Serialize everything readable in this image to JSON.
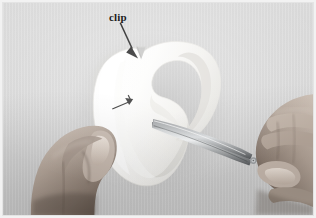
{
  "figure": {
    "kind": "instructional-photo",
    "background_color": "#d8d8d8",
    "frame_color": "#e4e4e4",
    "mat_color": "#ffffff"
  },
  "annotations": {
    "clip_label": {
      "text": "clip",
      "color": "#1d1d1d",
      "x": 106,
      "y": 9
    },
    "clip_arrow": {
      "name": "clip-pointer-arrow",
      "color": "#121212",
      "from_x": 120,
      "from_y": 22,
      "to_x": 134,
      "to_y": 54
    },
    "seam_arrow": {
      "name": "seam-direction-arrow",
      "color": "#1a1a1a",
      "from_x": 112,
      "from_y": 108,
      "to_x": 131,
      "to_y": 99
    }
  },
  "objects": {
    "fabric": {
      "name": "curved-fabric-piece",
      "color": "#fbfbfa",
      "shadow_color": "#b9b9b9",
      "edge_color": "#e9e9e7",
      "description": "white curved pattern piece with a V notch clipped at the top edge"
    },
    "notch": {
      "name": "clipped-notch",
      "color": "#cfcfcf",
      "description": "V-shaped clip cut into the concave curve at the top"
    },
    "scissors": {
      "name": "scissors",
      "blade_color": "#b7b9bb",
      "blade_highlight": "#f0f2f3",
      "blade_shadow": "#6d7073",
      "handle_color": "#8f9295",
      "description": "metal embroidery scissors angled from lower right toward the fabric"
    },
    "left_hand": {
      "name": "left-hand",
      "skin_color": "#b6a79c",
      "skin_shadow": "#6f6158",
      "nail_color": "#ded2c8",
      "description": "left hand pinching the fabric from below"
    },
    "right_hand": {
      "name": "right-hand",
      "skin_color": "#b3a498",
      "skin_shadow": "#6b5d54",
      "nail_color": "#dccfc4",
      "description": "right hand gripping the scissor handles at the right edge"
    }
  }
}
